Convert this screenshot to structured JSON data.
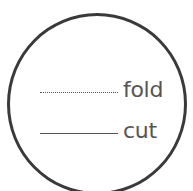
{
  "legend": {
    "items": [
      {
        "label": "fold",
        "line_style": "dotted"
      },
      {
        "label": "cut",
        "line_style": "solid"
      }
    ]
  },
  "colors": {
    "circle_stroke": "#3a3a3a",
    "text": "#555555",
    "background": "#ffffff"
  }
}
